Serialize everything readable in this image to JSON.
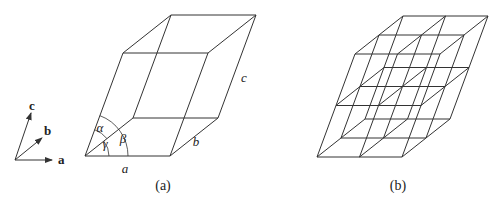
{
  "figure": {
    "axes_legend": {
      "origin": [
        15,
        160
      ],
      "vectors": [
        {
          "label": "a",
          "end": [
            52,
            160
          ],
          "label_pos": [
            58,
            164
          ]
        },
        {
          "label": "b",
          "end": [
            42,
            138
          ],
          "label_pos": [
            44,
            135
          ]
        },
        {
          "label": "c",
          "end": [
            31,
            113
          ],
          "label_pos": [
            29,
            110
          ]
        }
      ]
    },
    "panel_a": {
      "caption": "(a)",
      "caption_pos": [
        163,
        190
      ],
      "origin": [
        85,
        156
      ],
      "a": [
        85,
        0
      ],
      "b": [
        48,
        -38
      ],
      "c": [
        38,
        -103
      ],
      "edge_labels": [
        {
          "text": "a",
          "pos": [
            125,
            173
          ]
        },
        {
          "text": "b",
          "pos": [
            196,
            146
          ]
        },
        {
          "text": "c",
          "pos": [
            244,
            82
          ]
        }
      ],
      "angle_labels": [
        {
          "text": "α",
          "pos": [
            100,
            132
          ]
        },
        {
          "text": "γ",
          "pos": [
            105,
            148
          ]
        },
        {
          "text": "β",
          "pos": [
            123,
            143
          ]
        }
      ]
    },
    "panel_b": {
      "caption": "(b)",
      "caption_pos": [
        398,
        190
      ],
      "origin": [
        317,
        157
      ],
      "a": [
        42.5,
        0
      ],
      "b": [
        24,
        -19
      ],
      "c": [
        19,
        -51.5
      ],
      "divisions": 2
    },
    "line_color": "#333333"
  }
}
